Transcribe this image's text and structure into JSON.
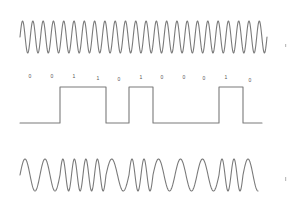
{
  "diagram": {
    "title": "",
    "type": "frequency-shift-keying",
    "colors": {
      "stroke": "#7a7a7a",
      "label": "#555555",
      "background": "#ffffff"
    },
    "carrier": {
      "label": "",
      "x_start": 20,
      "x_end": 267,
      "y_center": 37,
      "amplitude": 16,
      "cycles": 24
    },
    "data_signal": {
      "bits": [
        "0",
        "0",
        "1",
        "1",
        "0",
        "1",
        "0",
        "0",
        "0",
        "1",
        "0"
      ],
      "bit_label_x": [
        30,
        52,
        74,
        98,
        119,
        141,
        162,
        184,
        204,
        226,
        250
      ],
      "bit_label_y": [
        78,
        78,
        78,
        80,
        81,
        79,
        79,
        79,
        80,
        79,
        82
      ],
      "low_y": 123,
      "high_y": 87,
      "transitions_x": [
        20,
        60,
        106,
        129,
        153,
        219,
        243,
        262
      ],
      "gap_x": 180
    },
    "modulated": {
      "label": "",
      "x_start": 20,
      "x_end": 258,
      "y_center": 175,
      "amplitude": 16,
      "segments": [
        {
          "bit": "0",
          "x0": 20,
          "x1": 60,
          "cycles": 2
        },
        {
          "bit": "1",
          "x0": 60,
          "x1": 106,
          "cycles": 4
        },
        {
          "bit": "0",
          "x0": 106,
          "x1": 129,
          "cycles": 1
        },
        {
          "bit": "1",
          "x0": 129,
          "x1": 153,
          "cycles": 2
        },
        {
          "bit": "0",
          "x0": 153,
          "x1": 219,
          "cycles": 3
        },
        {
          "bit": "1",
          "x0": 219,
          "x1": 243,
          "cycles": 2
        },
        {
          "bit": "0",
          "x0": 243,
          "x1": 258,
          "cycles": 0.75
        }
      ]
    }
  }
}
